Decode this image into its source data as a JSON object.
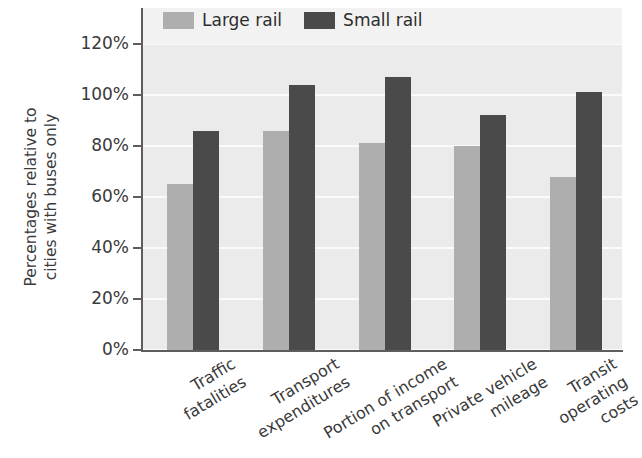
{
  "chart_data": {
    "type": "bar",
    "title": "",
    "subtitle": "",
    "xlabel": "",
    "ylabel": "Percentages relative to cities with buses only",
    "ylabel_lines": [
      "Percentages relative to",
      "cities with buses only"
    ],
    "categories": [
      "Traffic fatalities",
      "Transport expenditures",
      "Portion of income on transport",
      "Private vehicle mileage",
      "Transit operating costs"
    ],
    "category_lines": [
      [
        "Traffic",
        "fatalities"
      ],
      [
        "Transport",
        "expenditures"
      ],
      [
        "Portion of income",
        "on transport"
      ],
      [
        "Private vehicle",
        "mileage"
      ],
      [
        "Transit",
        "operating",
        "costs"
      ]
    ],
    "series": [
      {
        "name": "Large rail",
        "color": "#aeaeae",
        "values": [
          65,
          86,
          81,
          80,
          68
        ]
      },
      {
        "name": "Small rail",
        "color": "#4a4a4a",
        "values": [
          86,
          104,
          107,
          92,
          101
        ]
      }
    ],
    "ylim": [
      0,
      120
    ],
    "ytick_values": [
      0,
      20,
      40,
      60,
      80,
      100,
      120
    ],
    "ytick_labels": [
      "0%",
      "20%",
      "40%",
      "60%",
      "80%",
      "100%",
      "120%"
    ],
    "grid": true,
    "grid_orientation": "horizontal",
    "legend_position": "top-left-inside",
    "plot_background": "#ebebeb",
    "axis_color": "#5d5d5d",
    "value_unit": "%"
  },
  "legend": {
    "items": [
      {
        "label": "Large rail",
        "color": "#aeaeae"
      },
      {
        "label": "Small rail",
        "color": "#4a4a4a"
      }
    ]
  }
}
